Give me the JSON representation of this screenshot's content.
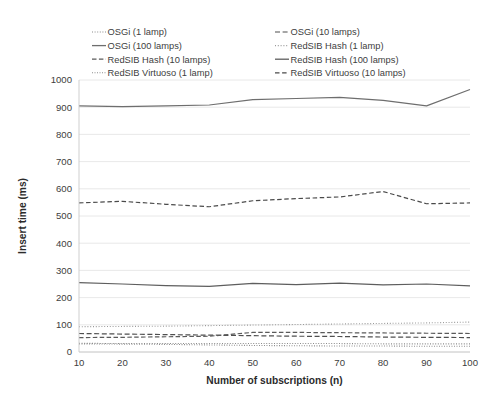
{
  "chart_data": {
    "type": "line",
    "title": "",
    "xlabel": "Number of subscriptions (n)",
    "ylabel": "Insert time (ms)",
    "x": [
      10,
      20,
      30,
      40,
      50,
      60,
      70,
      80,
      90,
      100
    ],
    "xtick_labels": [
      "10",
      "20",
      "30",
      "40",
      "50",
      "60",
      "70",
      "80",
      "90",
      "100"
    ],
    "ytick_labels": [
      "0",
      "100",
      "200",
      "300",
      "400",
      "500",
      "600",
      "700",
      "800",
      "900",
      "1000"
    ],
    "ylim": [
      0,
      1000
    ],
    "xlim": [
      10,
      100
    ],
    "grid": true,
    "legend_position": "top",
    "series": [
      {
        "name": "OSGi (1 lamp)",
        "label": "OSGi (1 lamp)",
        "style": "dotted",
        "color": "#8c8c8c",
        "width": 1.1,
        "dash": "1,1.6",
        "values": [
          32,
          31,
          31,
          31,
          31,
          31,
          31,
          30,
          30,
          30
        ]
      },
      {
        "name": "OSGi (10 lamps)",
        "label": "OSGi (10 lamps)",
        "style": "dashed",
        "color": "#4f4f4f",
        "width": 1.2,
        "dash": "5,2.6",
        "values": [
          68,
          66,
          64,
          62,
          60,
          58,
          57,
          55,
          54,
          53
        ]
      },
      {
        "name": "OSGi (100 lamps)",
        "label": "OSGi (100 lamps)",
        "style": "solid",
        "color": "#6e6e6e",
        "width": 1.2,
        "dash": "",
        "values": [
          905,
          902,
          905,
          908,
          928,
          932,
          936,
          925,
          905,
          965
        ]
      },
      {
        "name": "RedSIB Hash (1 lamp)",
        "label": "RedSIB Hash (1 lamp)",
        "style": "dotted",
        "color": "#9a9a9a",
        "width": 1.1,
        "dash": "1,1.8",
        "values": [
          93,
          94,
          95,
          97,
          99,
          101,
          103,
          105,
          107,
          110
        ]
      },
      {
        "name": "RedSIB Hash (10 lamps)",
        "label": "RedSIB Hash (10 lamps)",
        "style": "dashed",
        "color": "#5a5a5a",
        "width": 1.2,
        "dash": "4.5,2.4",
        "values": [
          53,
          54,
          56,
          58,
          72,
          72,
          71,
          70,
          69,
          68
        ]
      },
      {
        "name": "RedSIB Hash (100 lamps)",
        "label": "RedSIB Hash (100 lamps)",
        "style": "solid",
        "color": "#5e5e5e",
        "width": 1.2,
        "dash": "",
        "values": [
          255,
          250,
          244,
          241,
          252,
          248,
          253,
          247,
          250,
          243
        ]
      },
      {
        "name": "RedSIB Virtuoso (1 lamp)",
        "label": "RedSIB Virtuoso (1 lamp)",
        "style": "dotted",
        "color": "#8f8f8f",
        "width": 1.1,
        "dash": "1,1.5",
        "values": [
          30,
          29,
          28,
          26,
          24,
          23,
          22,
          22,
          21,
          21
        ]
      },
      {
        "name": "RedSIB Virtuoso (10 lamps)",
        "label": "RedSIB Virtuoso (10 lamps)",
        "style": "dashed",
        "color": "#4a4a4a",
        "width": 1.2,
        "dash": "4.5,2.6",
        "values": [
          548,
          554,
          543,
          534,
          556,
          564,
          570,
          590,
          545,
          548
        ]
      }
    ],
    "legend_layout": [
      [
        "OSGi (1 lamp)",
        "OSGi (10 lamps)"
      ],
      [
        "OSGi (100 lamps)",
        "RedSIB Hash (1 lamp)"
      ],
      [
        "RedSIB Hash (10 lamps)",
        "RedSIB Hash (100 lamps)"
      ],
      [
        "RedSIB Virtuoso (1 lamp)",
        "RedSIB Virtuoso (10 lamps)"
      ]
    ]
  }
}
